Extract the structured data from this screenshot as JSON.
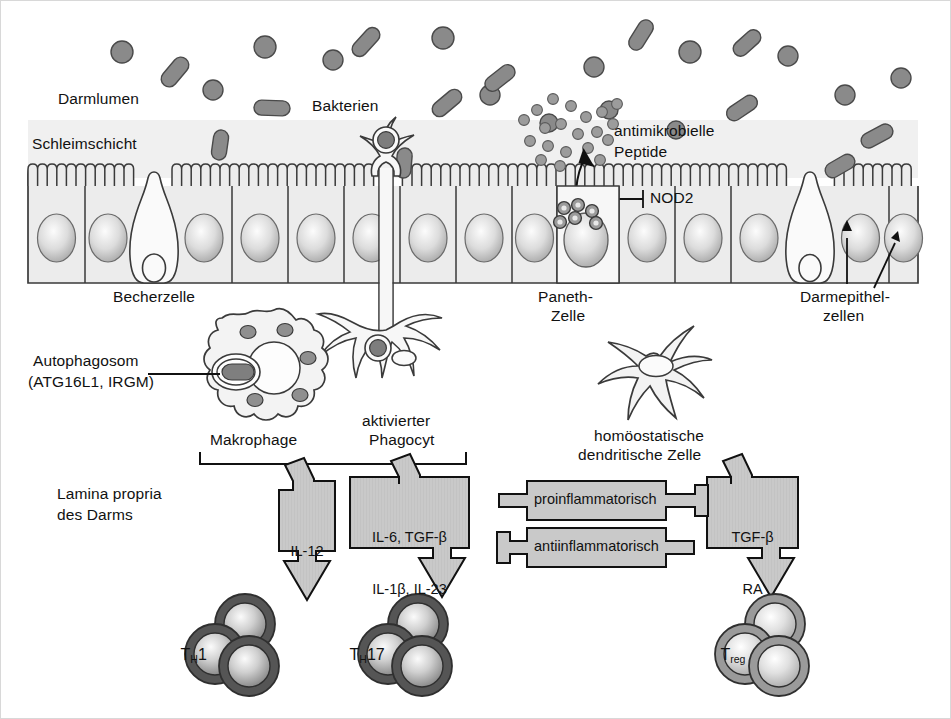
{
  "figure": {
    "domain": "biomedical-diagram",
    "title_visible": false,
    "language": "de"
  },
  "regions": {
    "lumen_label": "Darmlumen",
    "mucus_label": "Schleimschicht",
    "bacteria_label": "Bakterien",
    "amp_label_line1": "antimikrobielle",
    "amp_label_line2": "Peptide",
    "nod2_label": "NOD2",
    "goblet_label": "Becherzelle",
    "paneth_label_line1": "Paneth-",
    "paneth_label_line2": "Zelle",
    "epithelium_label_line1": "Darmepithel-",
    "epithelium_label_line2": "zellen",
    "autophagosome_line1": "Autophagosom",
    "autophagosome_line2": "(ATG16L1, IRGM)",
    "macrophage_label": "Makrophage",
    "phagocyte_label_line1": "aktivierter",
    "phagocyte_label_line2": "Phagocyt",
    "dendritic_label_line1": "homöostatische",
    "dendritic_label_line2": "dendritische Zelle",
    "lamina_line1": "Lamina propria",
    "lamina_line2": "des Darms"
  },
  "cytokine_boxes": [
    {
      "id": "il12",
      "lines": [
        "IL-12"
      ]
    },
    {
      "id": "th17",
      "lines": [
        "IL-6, TGF-β",
        "IL-1β, IL-23"
      ]
    },
    {
      "id": "treg",
      "lines": [
        "TGF-β",
        "RA"
      ]
    }
  ],
  "inflammation_bars": [
    {
      "id": "pro",
      "label": "proinflammatorisch",
      "direction": "right"
    },
    {
      "id": "anti",
      "label": "antiinflammatorisch",
      "direction": "left"
    }
  ],
  "tcells": [
    {
      "id": "th1",
      "base": "T",
      "sub": "H",
      "suffix": "1",
      "shade": "dark"
    },
    {
      "id": "th17",
      "base": "T",
      "sub": "H",
      "suffix": "17",
      "shade": "dark"
    },
    {
      "id": "treg",
      "base": "T",
      "sub": "reg",
      "suffix": "",
      "shade": "light"
    }
  ],
  "colors": {
    "outline": "#3a3a3a",
    "epithelium_fill": "#ececec",
    "mucus_fill": "#f0f0f0",
    "bacteria_fill": "#8a8a8a",
    "granule_fill": "#909090",
    "box_fill": "#c9c9c9",
    "tcell_dark": "#5a5a5a",
    "tcell_light": "#9a9a9a",
    "text": "#111111",
    "background": "#ffffff"
  }
}
